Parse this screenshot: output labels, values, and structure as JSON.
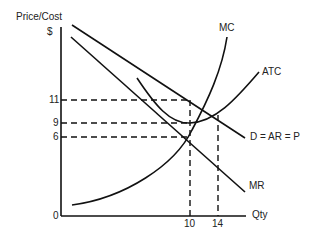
{
  "diagram": {
    "type": "monopoly_price_output",
    "y_axis_label": "Price/Cost",
    "y_axis_unit": "$",
    "x_axis_label": "Qty",
    "origin_label": "0",
    "y_ticks": [
      "11",
      "9",
      "6"
    ],
    "x_ticks": [
      "10",
      "14"
    ],
    "curves": {
      "mc": "MC",
      "atc": "ATC",
      "demand": "D  = AR = P",
      "mr": "MR"
    },
    "line_color": "#111111",
    "background": "#ffffff"
  }
}
